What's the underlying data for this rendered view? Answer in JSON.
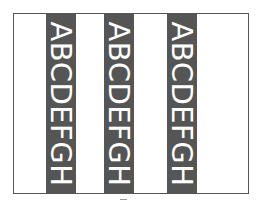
{
  "frame": {
    "border_color": "#555555",
    "background": "#ffffff"
  },
  "bands": [
    {
      "text": "ABCDEFGH",
      "color": "#555555",
      "text_color": "#ffffff"
    },
    {
      "text": "ABCDEFGH",
      "color": "#555555",
      "text_color": "#ffffff"
    },
    {
      "text": "ABCDEFGH",
      "color": "#555555",
      "text_color": "#ffffff"
    }
  ]
}
